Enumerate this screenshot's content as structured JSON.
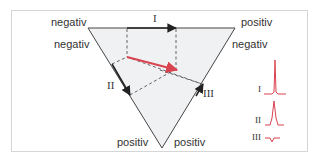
{
  "figure": {
    "labels": {
      "top_left_outer": "negativ",
      "top_left_inner": "negativ",
      "top_right_outer": "positiv",
      "top_right_inner": "negativ",
      "bottom_left": "positiv",
      "bottom_right": "positiv"
    },
    "leads": {
      "lead_1": "I",
      "lead_2": "II",
      "lead_3": "III"
    },
    "ecg_legend": [
      {
        "lead": "I",
        "deflection": "positive-tall"
      },
      {
        "lead": "II",
        "deflection": "positive-medium"
      },
      {
        "lead": "III",
        "deflection": "negative-small"
      }
    ],
    "colors": {
      "triangle_fill": "#f0f1f2",
      "axis_line": "#333333",
      "vector": "#d9434f",
      "ecg": "#d9434f",
      "dash": "#555555",
      "frame": "#d6d6d6"
    }
  }
}
